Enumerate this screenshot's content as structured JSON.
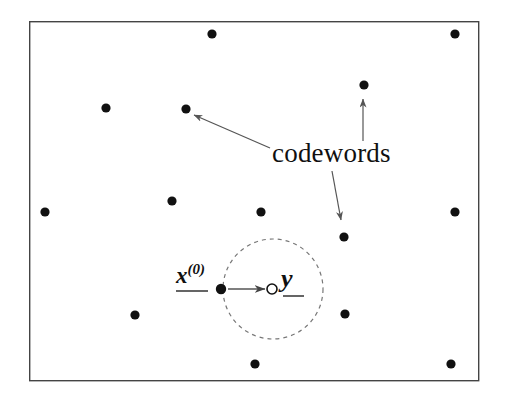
{
  "figure": {
    "type": "diagram",
    "title_text": "codewords",
    "background_color": "#ffffff",
    "ink_color": "#111111",
    "arrow_color": "#555555",
    "dashed_circle_color": "#777777",
    "frame": {
      "x": 29,
      "y": 21,
      "width": 449,
      "height": 359,
      "stroke": "#444444",
      "stroke_width": 1.4
    }
  },
  "labels": {
    "codewords": {
      "text": "codewords",
      "x": 272,
      "y": 140
    },
    "x0": {
      "text_base": "x",
      "text_sup": "(0)",
      "x": 176,
      "y": 262
    },
    "y": {
      "text": "y",
      "x": 281,
      "y": 266
    }
  },
  "codeword_points": [
    {
      "name": "codeword-1",
      "cx": 212,
      "cy": 34,
      "r": 4.6
    },
    {
      "name": "codeword-2",
      "cx": 455,
      "cy": 34,
      "r": 4.6
    },
    {
      "name": "codeword-3",
      "cx": 364,
      "cy": 85,
      "r": 4.6
    },
    {
      "name": "codeword-4",
      "cx": 106,
      "cy": 108,
      "r": 4.6
    },
    {
      "name": "codeword-5",
      "cx": 186,
      "cy": 109,
      "r": 4.6
    },
    {
      "name": "codeword-6",
      "cx": 172,
      "cy": 201,
      "r": 4.6
    },
    {
      "name": "codeword-7",
      "cx": 45,
      "cy": 212,
      "r": 4.6
    },
    {
      "name": "codeword-8",
      "cx": 261,
      "cy": 212,
      "r": 4.6
    },
    {
      "name": "codeword-9",
      "cx": 455,
      "cy": 212,
      "r": 4.6
    },
    {
      "name": "codeword-10",
      "cx": 344,
      "cy": 237,
      "r": 4.6
    },
    {
      "name": "codeword-11",
      "cx": 135,
      "cy": 315,
      "r": 4.6
    },
    {
      "name": "codeword-12",
      "cx": 345,
      "cy": 314,
      "r": 4.6
    },
    {
      "name": "codeword-13",
      "cx": 255,
      "cy": 364,
      "r": 4.6
    },
    {
      "name": "codeword-14",
      "cx": 451,
      "cy": 364,
      "r": 4.6
    }
  ],
  "decoding_sphere": {
    "name": "decoding-region-circle",
    "cx": 273,
    "cy": 289,
    "r": 50,
    "dash": "4 4",
    "stroke": "#777777",
    "stroke_width": 1.2
  },
  "initial_point": {
    "name": "x0-point",
    "cx": 221,
    "cy": 289,
    "r": 5.2,
    "fill": "#111111"
  },
  "received_point": {
    "name": "y-point",
    "cx": 272,
    "cy": 289,
    "r": 5.0,
    "fill": "#ffffff",
    "stroke": "#111111",
    "stroke_width": 1.6
  },
  "underlines": [
    {
      "name": "x0-underline",
      "x1": 176,
      "y1": 291,
      "x2": 208,
      "y2": 291
    },
    {
      "name": "y-underline",
      "x1": 283,
      "y1": 296,
      "x2": 304,
      "y2": 296
    }
  ],
  "arrows": [
    {
      "name": "arrow-to-codeword-upper-left",
      "x1": 270,
      "y1": 148,
      "x2": 194,
      "y2": 115,
      "head_at": "end"
    },
    {
      "name": "arrow-to-codeword-upper-right",
      "x1": 363,
      "y1": 141,
      "x2": 363,
      "y2": 99,
      "head_at": "end"
    },
    {
      "name": "arrow-to-codeword-lower-right",
      "x1": 332,
      "y1": 171,
      "x2": 341,
      "y2": 220,
      "head_at": "end"
    },
    {
      "name": "arrow-x0-to-y",
      "x1": 228,
      "y1": 289,
      "x2": 265,
      "y2": 289,
      "head_at": "end"
    }
  ]
}
